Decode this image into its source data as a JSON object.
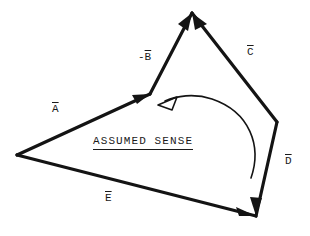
{
  "figure": {
    "width": 310,
    "height": 236,
    "background_color": "#ffffff",
    "stroke_color": "#141414"
  },
  "annotation": {
    "assumed_sense_label": "ASSUMED SENSE",
    "underlined": true
  },
  "vectors": [
    {
      "id": "A",
      "label_text": "A",
      "label_prefix": "",
      "overbar": true,
      "label_x": 52,
      "label_y": 104,
      "start": [
        17,
        155
      ],
      "end": [
        150,
        94
      ],
      "arrowhead": "filled",
      "arrow_at": "end"
    },
    {
      "id": "B",
      "label_text": "B",
      "label_prefix": "-",
      "overbar": true,
      "label_x": 138,
      "label_y": 52,
      "start": [
        150,
        94
      ],
      "end": [
        192,
        13
      ],
      "arrowhead": "filled",
      "arrow_at": "end"
    },
    {
      "id": "C",
      "label_text": "C",
      "label_prefix": "",
      "overbar": true,
      "label_x": 247,
      "label_y": 47,
      "start": [
        277,
        122
      ],
      "end": [
        192,
        13
      ],
      "arrowhead": "filled",
      "arrow_at": "end"
    },
    {
      "id": "D",
      "label_text": "D",
      "label_prefix": "",
      "overbar": true,
      "label_x": 285,
      "label_y": 156,
      "start": [
        277,
        122
      ],
      "end": [
        256,
        216
      ],
      "arrowhead": "filled",
      "arrow_at": "end"
    },
    {
      "id": "E",
      "label_text": "E",
      "label_prefix": "",
      "overbar": true,
      "label_x": 105,
      "label_y": 193,
      "start": [
        17,
        155
      ],
      "end": [
        256,
        216
      ],
      "arrowhead": "filled",
      "arrow_at": "end"
    }
  ],
  "sense_arc": {
    "direction": "counterclockwise-indicated",
    "arrow_style": "hollow-outline",
    "arrow_tip": [
      158,
      103
    ]
  }
}
